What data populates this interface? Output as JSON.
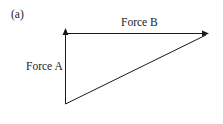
{
  "figure": {
    "panel_label": "(a)",
    "force_a_label": "Force A",
    "force_b_label": "Force B",
    "colors": {
      "line": "#1a1a1a",
      "background": "#ffffff"
    }
  },
  "diagram": {
    "type": "vector-triangle",
    "vectors": [
      {
        "name": "Force A",
        "from": [
          65,
          104
        ],
        "to": [
          65,
          29
        ],
        "direction": "up"
      },
      {
        "name": "Force B",
        "from": [
          65,
          33
        ],
        "to": [
          208,
          33
        ],
        "direction": "right"
      }
    ],
    "resultant_line": {
      "from": [
        65,
        104
      ],
      "to": [
        208,
        33
      ],
      "arrow": false
    }
  }
}
